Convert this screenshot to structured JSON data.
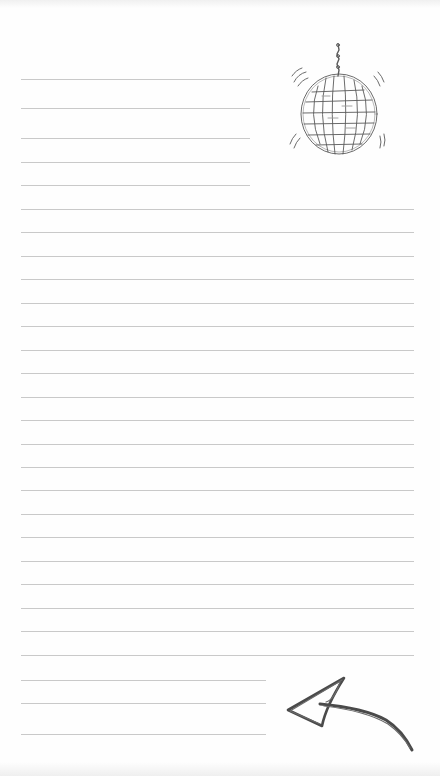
{
  "page": {
    "type": "lined notepaper",
    "paper_color": "#fefefe",
    "rule_color": "#c9c9c9",
    "sketch_color": "#555555"
  },
  "rules": {
    "top_short_count": 5,
    "full_width_count": 20,
    "bottom_short_count": 3
  },
  "illustrations": [
    {
      "name": "disco-ball",
      "description": "Hand-drawn disco ball hanging from a chain with motion marks"
    },
    {
      "name": "arrow",
      "description": "Hand-drawn pencil arrow pointing left"
    }
  ]
}
